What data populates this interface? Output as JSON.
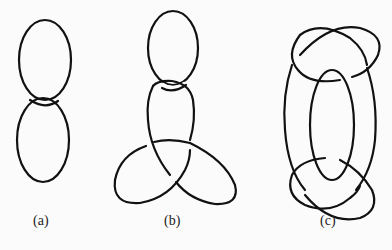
{
  "figure": {
    "panels": [
      {
        "id": "a",
        "label": "(a)",
        "description": "two linked ovals (Hopf link)"
      },
      {
        "id": "b",
        "label": "(b)",
        "description": "oval linked with trefoil knot"
      },
      {
        "id": "c",
        "label": "(c)",
        "description": "central oval linked with two interlaced loops"
      }
    ],
    "colors": {
      "stroke": "#111111",
      "background": "#fbfbfb"
    }
  }
}
